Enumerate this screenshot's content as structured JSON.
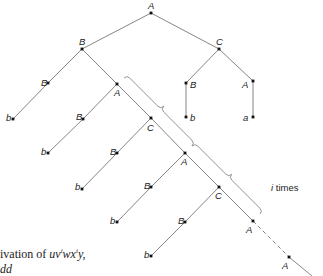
{
  "nodes": [
    {
      "id": "n0",
      "label": "A",
      "x": 151,
      "y": 13,
      "lx": 148,
      "ly": 9
    },
    {
      "id": "n1",
      "label": "B",
      "x": 82,
      "y": 49,
      "lx": 79,
      "ly": 45
    },
    {
      "id": "n2",
      "label": "C",
      "x": 219,
      "y": 49,
      "lx": 216,
      "ly": 45
    },
    {
      "id": "n3",
      "label": "B",
      "x": 48,
      "y": 83,
      "lx": 41,
      "ly": 86
    },
    {
      "id": "n4",
      "label": "b",
      "x": 13,
      "y": 119,
      "lx": 6,
      "ly": 121
    },
    {
      "id": "n5",
      "label": "A",
      "x": 117,
      "y": 84,
      "lx": 114,
      "ly": 96
    },
    {
      "id": "n6",
      "label": "B",
      "x": 186,
      "y": 83,
      "lx": 190,
      "ly": 88
    },
    {
      "id": "n7",
      "label": "b",
      "x": 186,
      "y": 117,
      "lx": 190,
      "ly": 121
    },
    {
      "id": "n8",
      "label": "A",
      "x": 253,
      "y": 81,
      "lx": 242,
      "ly": 88
    },
    {
      "id": "n9",
      "label": "a",
      "x": 253,
      "y": 117,
      "lx": 243,
      "ly": 121
    },
    {
      "id": "n10",
      "label": "B",
      "x": 83,
      "y": 119,
      "lx": 76,
      "ly": 120
    },
    {
      "id": "n11",
      "label": "b",
      "x": 48,
      "y": 153,
      "lx": 41,
      "ly": 155
    },
    {
      "id": "n12",
      "label": "C",
      "x": 151,
      "y": 118,
      "lx": 147,
      "ly": 131
    },
    {
      "id": "n13",
      "label": "B",
      "x": 117,
      "y": 153,
      "lx": 110,
      "ly": 155
    },
    {
      "id": "n14",
      "label": "b",
      "x": 82,
      "y": 189,
      "lx": 75,
      "ly": 190
    },
    {
      "id": "n15",
      "label": "A",
      "x": 185,
      "y": 153,
      "lx": 181,
      "ly": 165
    },
    {
      "id": "n16",
      "label": "B",
      "x": 151,
      "y": 187,
      "lx": 144,
      "ly": 189
    },
    {
      "id": "n17",
      "label": "b",
      "x": 117,
      "y": 222,
      "lx": 110,
      "ly": 224
    },
    {
      "id": "n18",
      "label": "C",
      "x": 219,
      "y": 187,
      "lx": 215,
      "ly": 199
    },
    {
      "id": "n19",
      "label": "B",
      "x": 185,
      "y": 222,
      "lx": 178,
      "ly": 224
    },
    {
      "id": "n20",
      "label": "b",
      "x": 151,
      "y": 256,
      "lx": 144,
      "ly": 258
    },
    {
      "id": "n21",
      "label": "A",
      "x": 253,
      "y": 221,
      "lx": 246,
      "ly": 233
    },
    {
      "id": "n22",
      "label": "A",
      "x": 289,
      "y": 257,
      "lx": 282,
      "ly": 269
    }
  ],
  "edges": [
    [
      "n0",
      "n1"
    ],
    [
      "n0",
      "n2"
    ],
    [
      "n1",
      "n3"
    ],
    [
      "n3",
      "n4"
    ],
    [
      "n1",
      "n5"
    ],
    [
      "n2",
      "n6"
    ],
    [
      "n6",
      "n7"
    ],
    [
      "n2",
      "n8"
    ],
    [
      "n8",
      "n9"
    ],
    [
      "n5",
      "n10"
    ],
    [
      "n10",
      "n11"
    ],
    [
      "n5",
      "n12"
    ],
    [
      "n12",
      "n13"
    ],
    [
      "n13",
      "n14"
    ],
    [
      "n12",
      "n15"
    ],
    [
      "n15",
      "n16"
    ],
    [
      "n16",
      "n17"
    ],
    [
      "n15",
      "n18"
    ],
    [
      "n18",
      "n19"
    ],
    [
      "n19",
      "n20"
    ],
    [
      "n18",
      "n21"
    ]
  ],
  "dashed_edges": [
    [
      "n21",
      "n22"
    ]
  ],
  "tail_edge": {
    "x1": 289,
    "y1": 257,
    "x2": 312,
    "y2": 276
  },
  "braces": [
    {
      "x1": 124,
      "y1": 78,
      "x2": 192,
      "y2": 146
    },
    {
      "x1": 192,
      "y1": 146,
      "x2": 260,
      "y2": 214
    }
  ],
  "repeat_label": {
    "var": "i",
    "text": " times",
    "x": 271,
    "y": 191
  },
  "caption": {
    "prefix": "ivation of ",
    "formula_u": "uv",
    "sup1": "i",
    "formula_w": "wx",
    "sup2": "i",
    "formula_y": "y,",
    "line2": "dd"
  },
  "colors": {
    "edge": "#777777",
    "node": "#111111",
    "text": "#222222"
  }
}
